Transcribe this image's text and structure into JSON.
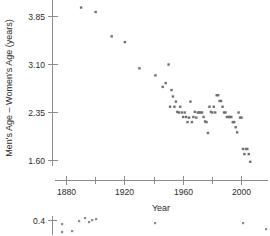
{
  "chart_data": {
    "type": "scatter",
    "title": "",
    "xlabel": "Year",
    "ylabel": "Men's Age – Women's Age (years)",
    "xlim": [
      1872,
      2014
    ],
    "ylim": [
      1.52,
      4.05
    ],
    "grid": false,
    "legend": null,
    "x_ticks_major": [
      1880,
      1920,
      1960,
      2000
    ],
    "x_ticks_minor": [
      1900,
      1940,
      1980
    ],
    "x_tick_labels": [
      "1880",
      "1920",
      "1960",
      "2000"
    ],
    "y_ticks": [
      1.6,
      2.35,
      3.1,
      3.85
    ],
    "y_tick_labels": [
      "1.60",
      "2.35",
      "3.10",
      "3.85"
    ],
    "marker": "square",
    "marker_color": "#6f6f72",
    "points": [
      {
        "x": 1890,
        "y": 3.99
      },
      {
        "x": 1900,
        "y": 3.92
      },
      {
        "x": 1911,
        "y": 3.54
      },
      {
        "x": 1920,
        "y": 3.45
      },
      {
        "x": 1930,
        "y": 3.04
      },
      {
        "x": 1950,
        "y": 3.1
      },
      {
        "x": 1941,
        "y": 2.93
      },
      {
        "x": 1948,
        "y": 2.81
      },
      {
        "x": 1946,
        "y": 2.75
      },
      {
        "x": 1952,
        "y": 2.7
      },
      {
        "x": 1953,
        "y": 2.6
      },
      {
        "x": 1955,
        "y": 2.52
      },
      {
        "x": 1954,
        "y": 2.44
      },
      {
        "x": 1956,
        "y": 2.36
      },
      {
        "x": 1957,
        "y": 2.35
      },
      {
        "x": 1959,
        "y": 2.35
      },
      {
        "x": 1961,
        "y": 2.35
      },
      {
        "x": 1960,
        "y": 2.28
      },
      {
        "x": 1962,
        "y": 2.28
      },
      {
        "x": 1964,
        "y": 2.27
      },
      {
        "x": 1963,
        "y": 2.2
      },
      {
        "x": 1966,
        "y": 2.2
      },
      {
        "x": 1967,
        "y": 2.28
      },
      {
        "x": 1969,
        "y": 2.27
      },
      {
        "x": 1968,
        "y": 2.36
      },
      {
        "x": 1970,
        "y": 2.35
      },
      {
        "x": 1971,
        "y": 2.35
      },
      {
        "x": 1972,
        "y": 2.35
      },
      {
        "x": 1973,
        "y": 2.35
      },
      {
        "x": 1965,
        "y": 2.52
      },
      {
        "x": 1974,
        "y": 2.28
      },
      {
        "x": 1975,
        "y": 2.21
      },
      {
        "x": 1976,
        "y": 2.2
      },
      {
        "x": 1977,
        "y": 2.03
      },
      {
        "x": 1979,
        "y": 2.36
      },
      {
        "x": 1980,
        "y": 2.35
      },
      {
        "x": 1982,
        "y": 2.35
      },
      {
        "x": 1983,
        "y": 2.62
      },
      {
        "x": 1984,
        "y": 2.62
      },
      {
        "x": 1985,
        "y": 2.53
      },
      {
        "x": 1986,
        "y": 2.53
      },
      {
        "x": 1987,
        "y": 2.44
      },
      {
        "x": 1988,
        "y": 2.35
      },
      {
        "x": 1989,
        "y": 2.35
      },
      {
        "x": 1990,
        "y": 2.28
      },
      {
        "x": 1991,
        "y": 2.28
      },
      {
        "x": 1992,
        "y": 2.28
      },
      {
        "x": 1993,
        "y": 2.28
      },
      {
        "x": 1994,
        "y": 2.2
      },
      {
        "x": 1995,
        "y": 2.2
      },
      {
        "x": 1996,
        "y": 2.12
      },
      {
        "x": 1997,
        "y": 2.04
      },
      {
        "x": 1998,
        "y": 2.35
      },
      {
        "x": 1999,
        "y": 2.27
      },
      {
        "x": 2000,
        "y": 2.27
      },
      {
        "x": 2001,
        "y": 1.78
      },
      {
        "x": 2003,
        "y": 1.78
      },
      {
        "x": 2004,
        "y": 1.78
      },
      {
        "x": 2002,
        "y": 1.7
      },
      {
        "x": 2005,
        "y": 1.7
      },
      {
        "x": 2006,
        "y": 1.58
      },
      {
        "x": 1978,
        "y": 2.44
      },
      {
        "x": 1981,
        "y": 2.44
      },
      {
        "x": 1958,
        "y": 2.44
      },
      {
        "x": 1951,
        "y": 2.44
      }
    ]
  },
  "secondary_chart": {
    "type": "scatter",
    "visible_partial": true,
    "y_tick_labels": [
      "0.4"
    ],
    "points": [
      {
        "px": 62,
        "py": 224
      },
      {
        "px": 79,
        "py": 221
      },
      {
        "px": 85,
        "py": 218
      },
      {
        "px": 89,
        "py": 222
      },
      {
        "px": 92,
        "py": 220
      },
      {
        "px": 96,
        "py": 219
      },
      {
        "px": 62,
        "py": 232
      },
      {
        "px": 72,
        "py": 231
      },
      {
        "px": 155,
        "py": 223
      },
      {
        "px": 243,
        "py": 223
      },
      {
        "px": 266,
        "py": 229
      }
    ]
  }
}
